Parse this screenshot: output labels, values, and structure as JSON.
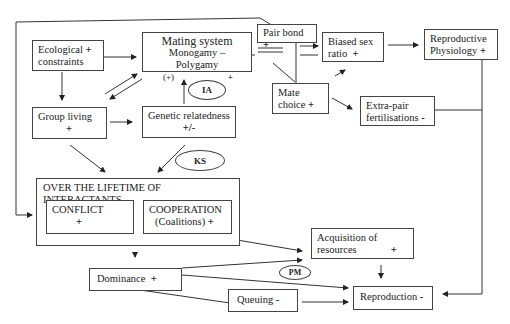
{
  "nodes": {
    "ecological": {
      "line1": "Ecological",
      "line2": "constraints",
      "sign": "+"
    },
    "mating": {
      "title": "Mating system",
      "subtitle": "Monogamy – Polygamy",
      "sign_left": "(+)",
      "sign_right": "+"
    },
    "pair_bond": {
      "label": "Pair bond",
      "sign": "+"
    },
    "biased": {
      "line1": "Biased sex",
      "line2": "ratio",
      "sign": "+"
    },
    "repro_phys": {
      "line1": "Reproductive",
      "line2": "Physiology",
      "sign": "+"
    },
    "mate_choice": {
      "line1": "Mate",
      "line2": "choice",
      "sign": "+"
    },
    "extra_pair": {
      "line1": "Extra-pair",
      "line2": "fertilisations",
      "sign": "-"
    },
    "group_living": {
      "label": "Group living",
      "sign": "+"
    },
    "genetic": {
      "label": "Genetic relatedness",
      "sign": "+/-"
    },
    "lifetime": {
      "title": "OVER THE LIFETIME OF INTERACTANTS"
    },
    "conflict": {
      "label": "CONFLICT",
      "sign": "+"
    },
    "cooperation": {
      "label": "COOPERATION",
      "sub": "(Coalitions)",
      "sign": "+"
    },
    "acquisition": {
      "line1": "Acquisition of",
      "line2": "resources",
      "sign": "+"
    },
    "dominance": {
      "label": "Dominance",
      "sign": "+"
    },
    "queuing": {
      "label": "Queuing",
      "sign": "-"
    },
    "reproduction": {
      "label": "Reproduction",
      "sign": "-"
    }
  },
  "ovals": {
    "ia": "IA",
    "ks": "KS",
    "pm": "PM"
  }
}
